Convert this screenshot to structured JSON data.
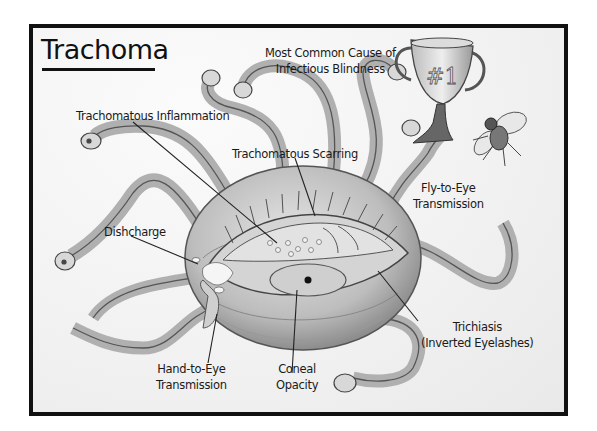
{
  "title": "Trachoma",
  "labels": {
    "most_common_line1": "Most Common Cause of",
    "most_common_line2": "Infectious Blindness",
    "inflammation": "Trachomatous Inflammation",
    "scarring": "Trachomatous Scarring",
    "fly_line1": "Fly-to-Eye",
    "fly_line2": "Transmission",
    "discharge": "Dishcharge",
    "trichiasis_line1": "Trichiasis",
    "trichiasis_line2": "(Inverted Eyelashes)",
    "hand_line1": "Hand-to-Eye",
    "hand_line2": "Transmission",
    "opacity_line1": "Coneal",
    "opacity_line2": "Opacity"
  },
  "trophy_text": "#1",
  "colors": {
    "border": "#111111",
    "background": "#f4f4f4",
    "creature": "#c8c8c8",
    "creature_shade": "#9a9a9a",
    "text": "#1a1a1a"
  }
}
